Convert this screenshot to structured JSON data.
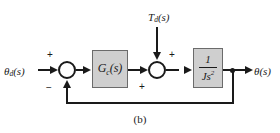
{
  "figure": {
    "caption": "(b)",
    "type": "control-system-block-diagram"
  },
  "signals": {
    "input": {
      "name": "theta_d(s)",
      "base": "θ",
      "sub": "d",
      "arg": "(s)"
    },
    "disturbance": {
      "name": "T_d(s)",
      "base": "T",
      "sub": "d",
      "arg": "(s)"
    },
    "output": {
      "name": "theta(s)",
      "base": "θ",
      "sub": "",
      "arg": "(s)"
    }
  },
  "blocks": {
    "controller": {
      "label": "G",
      "sub": "c",
      "arg": "(s)"
    },
    "plant": {
      "numerator": "1",
      "denominator": "Js",
      "exponent": "2"
    }
  },
  "summing_junctions": [
    {
      "id": "sum-1",
      "signs": {
        "input": "+",
        "feedback": "−"
      }
    },
    {
      "id": "sum-2",
      "signs": {
        "forward": "+",
        "disturbance": "+"
      }
    }
  ],
  "colors": {
    "block_fill": "#cfcfcf",
    "block_border": "#6b6b6b",
    "line": "#1a1a1a",
    "background": "#ffffff"
  }
}
